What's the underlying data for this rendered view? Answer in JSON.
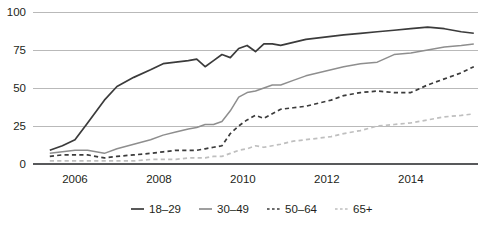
{
  "chart_data": {
    "type": "line",
    "title": "",
    "subtitle": "",
    "xlabel": "",
    "ylabel": "",
    "xlim": [
      2005.0,
      2015.6
    ],
    "ylim": [
      0,
      100
    ],
    "grid": true,
    "legend_position": "bottom",
    "y_ticks": [
      "0",
      "25",
      "50",
      "75",
      "100"
    ],
    "y_tick_values": [
      0,
      25,
      50,
      75,
      100
    ],
    "x_ticks": [
      "2006",
      "2008",
      "2010",
      "2012",
      "2014"
    ],
    "x_tick_values": [
      2006,
      2008,
      2010,
      2012,
      2014
    ],
    "series": [
      {
        "name": "18–29",
        "color": "#3b3b3b",
        "style": "solid",
        "width": 1.7,
        "x": [
          2005.4,
          2005.7,
          2006.0,
          2006.3,
          2006.7,
          2007.0,
          2007.4,
          2007.8,
          2008.1,
          2008.4,
          2008.7,
          2008.9,
          2009.1,
          2009.3,
          2009.5,
          2009.7,
          2009.9,
          2010.1,
          2010.3,
          2010.5,
          2010.7,
          2010.9,
          2011.2,
          2011.5,
          2011.8,
          2012.1,
          2012.4,
          2012.8,
          2013.2,
          2013.6,
          2014.0,
          2014.4,
          2014.8,
          2015.2,
          2015.5
        ],
        "values": [
          9,
          12,
          16,
          27,
          42,
          51,
          57,
          62,
          66,
          67,
          68,
          69,
          64,
          68,
          72,
          70,
          76,
          78,
          74,
          79,
          79,
          78,
          80,
          82,
          83,
          84,
          85,
          86,
          87,
          88,
          89,
          90,
          89,
          87,
          86
        ]
      },
      {
        "name": "30–49",
        "color": "#8e8e8e",
        "style": "solid",
        "width": 1.5,
        "x": [
          2005.4,
          2005.7,
          2006.0,
          2006.3,
          2006.7,
          2007.0,
          2007.4,
          2007.8,
          2008.1,
          2008.4,
          2008.7,
          2008.9,
          2009.1,
          2009.3,
          2009.5,
          2009.7,
          2009.9,
          2010.1,
          2010.3,
          2010.5,
          2010.7,
          2010.9,
          2011.2,
          2011.5,
          2011.8,
          2012.1,
          2012.4,
          2012.8,
          2013.2,
          2013.6,
          2014.0,
          2014.4,
          2014.8,
          2015.2,
          2015.5
        ],
        "values": [
          7,
          8,
          9,
          9,
          7,
          10,
          13,
          16,
          19,
          21,
          23,
          24,
          26,
          26,
          28,
          35,
          44,
          47,
          48,
          50,
          52,
          52,
          55,
          58,
          60,
          62,
          64,
          66,
          67,
          72,
          73,
          75,
          77,
          78,
          79
        ]
      },
      {
        "name": "50–64",
        "color": "#3b3b3b",
        "style": "dashed",
        "width": 1.7,
        "x": [
          2005.4,
          2005.7,
          2006.0,
          2006.3,
          2006.7,
          2007.0,
          2007.4,
          2007.8,
          2008.1,
          2008.4,
          2008.7,
          2008.9,
          2009.1,
          2009.3,
          2009.5,
          2009.7,
          2009.9,
          2010.1,
          2010.3,
          2010.5,
          2010.7,
          2010.9,
          2011.2,
          2011.5,
          2011.8,
          2012.1,
          2012.4,
          2012.8,
          2013.2,
          2013.6,
          2014.0,
          2014.4,
          2014.8,
          2015.2,
          2015.5
        ],
        "values": [
          5,
          6,
          6,
          6,
          4,
          5,
          6,
          7,
          8,
          9,
          9,
          9,
          10,
          11,
          12,
          20,
          25,
          29,
          32,
          30,
          33,
          36,
          37,
          38,
          40,
          42,
          45,
          47,
          48,
          47,
          47,
          52,
          56,
          60,
          64
        ]
      },
      {
        "name": "65+",
        "color": "#bfbfbf",
        "style": "dashed",
        "width": 1.7,
        "x": [
          2005.4,
          2005.7,
          2006.0,
          2006.3,
          2006.7,
          2007.0,
          2007.4,
          2007.8,
          2008.1,
          2008.4,
          2008.7,
          2008.9,
          2009.1,
          2009.3,
          2009.5,
          2009.7,
          2009.9,
          2010.1,
          2010.3,
          2010.5,
          2010.7,
          2010.9,
          2011.2,
          2011.5,
          2011.8,
          2012.1,
          2012.4,
          2012.8,
          2013.2,
          2013.6,
          2014.0,
          2014.4,
          2014.8,
          2015.2,
          2015.5
        ],
        "values": [
          2,
          2,
          2,
          2,
          2,
          2,
          2,
          3,
          3,
          3,
          4,
          4,
          4,
          5,
          5,
          7,
          9,
          10,
          12,
          11,
          12,
          13,
          15,
          16,
          17,
          18,
          20,
          22,
          25,
          26,
          27,
          29,
          31,
          32,
          33
        ]
      }
    ]
  },
  "legend": {
    "items": [
      {
        "label": "18–29",
        "color": "#3b3b3b",
        "style": "solid"
      },
      {
        "label": "30–49",
        "color": "#8e8e8e",
        "style": "solid"
      },
      {
        "label": "50–64",
        "color": "#3b3b3b",
        "style": "dashed"
      },
      {
        "label": "65+",
        "color": "#bfbfbf",
        "style": "dashed"
      }
    ]
  },
  "colors": {
    "gridline": "#b9b9b9",
    "axis": "#58595b",
    "text": "#231f20",
    "background": "#ffffff"
  }
}
